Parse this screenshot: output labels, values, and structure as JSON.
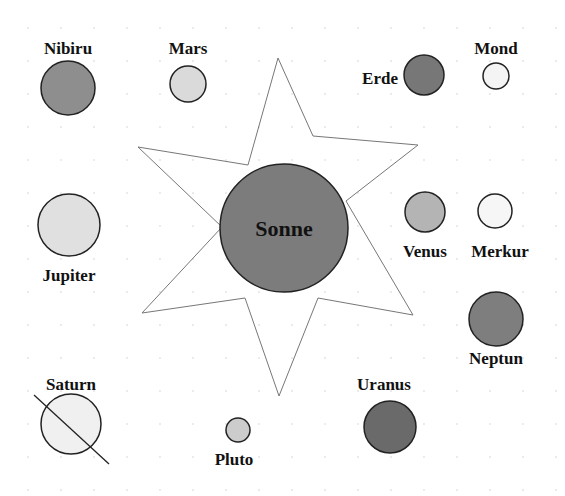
{
  "diagram": {
    "colors": {
      "background": "#ffffff",
      "outline": "#222222",
      "star_line": "#777777",
      "label": "#111111",
      "grid_dot": "#e2e2e2"
    },
    "sun": {
      "label": "Sonne",
      "cx": 284,
      "cy": 228,
      "r": 64,
      "fill": "#7c7c7c"
    },
    "star": {
      "points": [
        [
          278,
          58
        ],
        [
          313,
          136
        ],
        [
          418,
          145
        ],
        [
          346,
          201
        ],
        [
          413,
          315
        ],
        [
          318,
          298
        ],
        [
          279,
          396
        ],
        [
          245,
          298
        ],
        [
          142,
          313
        ],
        [
          222,
          227
        ],
        [
          138,
          147
        ],
        [
          248,
          165
        ]
      ]
    },
    "bodies": [
      {
        "name": "Nibiru",
        "cx": 68,
        "cy": 88,
        "r": 27,
        "fill": "#8e8e8e",
        "label_x": 68,
        "label_y": 54,
        "anchor": "middle"
      },
      {
        "name": "Mars",
        "cx": 188,
        "cy": 84,
        "r": 18,
        "fill": "#dadada",
        "label_x": 188,
        "label_y": 54,
        "anchor": "middle"
      },
      {
        "name": "Erde",
        "cx": 424,
        "cy": 75,
        "r": 20,
        "fill": "#777777",
        "label_x": 398,
        "label_y": 84,
        "anchor": "end"
      },
      {
        "name": "Mond",
        "cx": 496,
        "cy": 76,
        "r": 13,
        "fill": "#f4f4f4",
        "label_x": 496,
        "label_y": 54,
        "anchor": "middle"
      },
      {
        "name": "Jupiter",
        "cx": 69,
        "cy": 225,
        "r": 31,
        "fill": "#e0e0e0",
        "label_x": 69,
        "label_y": 281,
        "anchor": "middle"
      },
      {
        "name": "Venus",
        "cx": 425,
        "cy": 212,
        "r": 20,
        "fill": "#b4b4b4",
        "label_x": 425,
        "label_y": 257,
        "anchor": "middle"
      },
      {
        "name": "Merkur",
        "cx": 495,
        "cy": 211,
        "r": 17,
        "fill": "#f6f6f6",
        "label_x": 500,
        "label_y": 257,
        "anchor": "middle"
      },
      {
        "name": "Neptun",
        "cx": 496,
        "cy": 319,
        "r": 27,
        "fill": "#7e7e7e",
        "label_x": 496,
        "label_y": 364,
        "anchor": "middle"
      },
      {
        "name": "Saturn",
        "cx": 71,
        "cy": 424,
        "r": 30,
        "fill": "#f0f0f0",
        "label_x": 71,
        "label_y": 390,
        "anchor": "middle",
        "ring": [
          34,
          395,
          109,
          464
        ]
      },
      {
        "name": "Pluto",
        "cx": 238,
        "cy": 430,
        "r": 12,
        "fill": "#cccccc",
        "label_x": 234,
        "label_y": 465,
        "anchor": "middle"
      },
      {
        "name": "Uranus",
        "cx": 390,
        "cy": 427,
        "r": 26,
        "fill": "#6a6a6a",
        "label_x": 384,
        "label_y": 390,
        "anchor": "middle"
      }
    ]
  }
}
